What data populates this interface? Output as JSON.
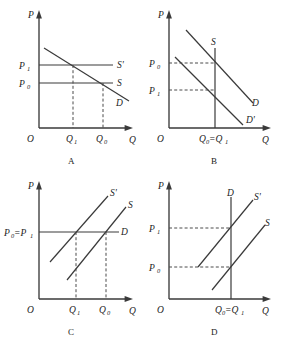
{
  "figure": {
    "title": "",
    "panels": [
      {
        "id": "A",
        "letter": "A",
        "axes": {
          "y": "P",
          "x": "Q",
          "origin": "O"
        },
        "y_ticks": [
          "P1",
          "P0"
        ],
        "x_ticks": [
          "Q1",
          "Q0"
        ],
        "curve_labels": [
          "S'",
          "S",
          "D"
        ],
        "description": "Downward sloping demand D crosses two horizontal supply lines S' (at P1) and S (at P0); Q1 < Q0"
      },
      {
        "id": "B",
        "letter": "B",
        "axes": {
          "y": "P",
          "x": "Q",
          "origin": "O"
        },
        "y_ticks": [
          "P0",
          "P1"
        ],
        "x_ticks": [
          "Q0=Q1"
        ],
        "curve_labels": [
          "S",
          "D",
          "D'"
        ],
        "description": "Vertical supply S at Q0=Q1 crosses demand D at P0 and demand D' at P1"
      },
      {
        "id": "C",
        "letter": "C",
        "axes": {
          "y": "P",
          "x": "Q",
          "origin": "O"
        },
        "y_ticks": [
          "P0=P1"
        ],
        "x_ticks": [
          "Q1",
          "Q0"
        ],
        "curve_labels": [
          "S'",
          "S",
          "D"
        ],
        "description": "Horizontal demand D at P0=P1 crosses upward supply S' at Q1 and supply S at Q0"
      },
      {
        "id": "D",
        "letter": "D",
        "axes": {
          "y": "P",
          "x": "Q",
          "origin": "O"
        },
        "y_ticks": [
          "P1",
          "P0"
        ],
        "x_ticks": [
          "Q0=Q1"
        ],
        "curve_labels": [
          "D",
          "S'",
          "S"
        ],
        "description": "Vertical demand D at Q0=Q1 crosses upward supply S' at P1 and supply S at P0"
      }
    ],
    "symbols": {
      "P": "P",
      "Q": "Q",
      "O": "O",
      "S": "S",
      "Sprime": "S'",
      "D": "D",
      "Dprime": "D'",
      "P0": "P",
      "P0sub": "0",
      "P1": "P",
      "P1sub": "1",
      "Q0": "Q",
      "Q0sub": "0",
      "Q1": "Q",
      "Q1sub": "1",
      "P0eqP1_a": "P",
      "P0eqP1_b": "0",
      "P0eqP1_c": "=P",
      "P0eqP1_d": "1",
      "Q0eqQ1_a": "Q",
      "Q0eqQ1_b": "0",
      "Q0eqQ1_c": "=Q",
      "Q0eqQ1_d": "1"
    },
    "colors": {
      "ink": "#3a3a3a",
      "text": "#222222",
      "background": "#ffffff"
    }
  }
}
